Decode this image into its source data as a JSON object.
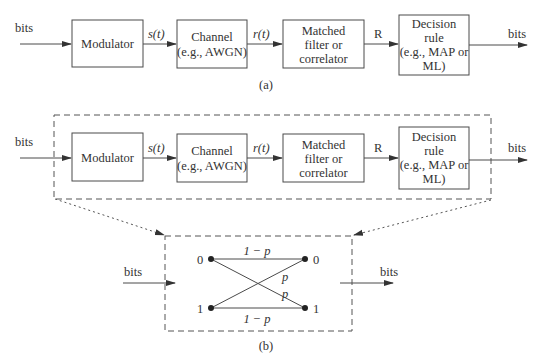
{
  "diagram_a": {
    "caption": "(a)",
    "input_label": "bits",
    "output_label": "bits",
    "blocks": [
      {
        "id": "modulator",
        "lines": [
          "Modulator"
        ]
      },
      {
        "id": "channel",
        "lines": [
          "Channel",
          "(e.g., AWGN)"
        ]
      },
      {
        "id": "matched-filter",
        "lines": [
          "Matched",
          "filter or",
          "correlator"
        ]
      },
      {
        "id": "decision-rule",
        "lines": [
          "Decision",
          "rule",
          "(e.g., MAP or",
          "ML)"
        ]
      }
    ],
    "signals": [
      "s(t)",
      "r(t)",
      "R"
    ]
  },
  "diagram_b": {
    "caption": "(b)",
    "input_label": "bits",
    "output_label": "bits",
    "blocks": [
      {
        "id": "modulator",
        "lines": [
          "Modulator"
        ]
      },
      {
        "id": "channel",
        "lines": [
          "Channel",
          "(e.g., AWGN)"
        ]
      },
      {
        "id": "matched-filter",
        "lines": [
          "Matched",
          "filter or",
          "correlator"
        ]
      },
      {
        "id": "decision-rule",
        "lines": [
          "Decision",
          "rule",
          "(e.g., MAP or",
          "ML)"
        ]
      }
    ],
    "signals": [
      "s(t)",
      "r(t)",
      "R"
    ],
    "bsc": {
      "input_label": "bits",
      "output_label": "bits",
      "left_nodes": [
        "0",
        "1"
      ],
      "right_nodes": [
        "0",
        "1"
      ],
      "top_edge_label": "1 − p",
      "bottom_edge_label": "1 − p",
      "cross_label_upper": "p",
      "cross_label_lower": "p"
    }
  }
}
